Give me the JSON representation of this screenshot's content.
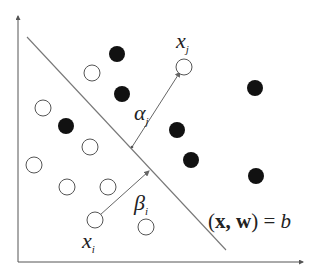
{
  "diagram": {
    "colors": {
      "line": "#777777",
      "axis": "#555555",
      "filled": "#111111",
      "open_stroke": "#555555",
      "open_fill": "#ffffff"
    },
    "axes": {
      "y_axis": {
        "x": 18,
        "y1": 262,
        "y2": 16
      },
      "x_axis": {
        "y": 262,
        "x1": 18,
        "x2": 303
      }
    },
    "hyperplane": {
      "x1": 27,
      "y1": 37,
      "x2": 226,
      "y2": 250
    },
    "filled_points": [
      {
        "cx": 117,
        "cy": 54
      },
      {
        "cx": 122,
        "cy": 94
      },
      {
        "cx": 66,
        "cy": 126
      },
      {
        "cx": 177,
        "cy": 130
      },
      {
        "cx": 191,
        "cy": 160
      },
      {
        "cx": 255,
        "cy": 88
      },
      {
        "cx": 256,
        "cy": 176
      }
    ],
    "open_points": [
      {
        "cx": 92,
        "cy": 73
      },
      {
        "cx": 184,
        "cy": 67
      },
      {
        "cx": 43,
        "cy": 108
      },
      {
        "cx": 90,
        "cy": 147
      },
      {
        "cx": 34,
        "cy": 165
      },
      {
        "cx": 67,
        "cy": 187
      },
      {
        "cx": 108,
        "cy": 187
      },
      {
        "cx": 95,
        "cy": 220
      },
      {
        "cx": 146,
        "cy": 227
      }
    ],
    "arrows": [
      {
        "name": "alpha",
        "x1": 132,
        "y1": 147,
        "x2": 180,
        "y2": 72
      },
      {
        "name": "beta",
        "x1": 100,
        "y1": 215,
        "x2": 149,
        "y2": 171
      }
    ],
    "labels": {
      "xj_main": "x",
      "xj_sub": "j",
      "alpha_main": "α",
      "alpha_sub": "j",
      "beta_main": "β",
      "beta_sub": "i",
      "xi_main": "x",
      "xi_sub": "i",
      "equation_lparen": "(",
      "equation_x": "x",
      "equation_comma": ", ",
      "equation_w": "w",
      "equation_rparen": ")",
      "equation_eq": " = ",
      "equation_b": "b"
    }
  }
}
